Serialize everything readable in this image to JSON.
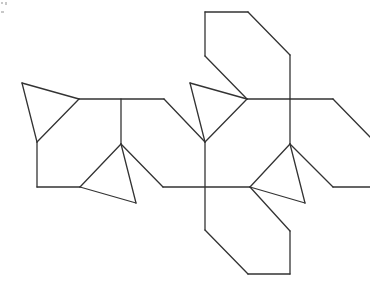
{
  "diagram": {
    "title": "",
    "type": "net-of-polyhedron",
    "stroke_color": "#333333",
    "stroke_width": 1.3,
    "background": "#ffffff",
    "segments": [
      [
        22,
        83,
        79,
        99
      ],
      [
        79,
        99,
        37,
        142
      ],
      [
        37,
        142,
        22,
        83
      ],
      [
        79,
        99,
        164,
        99
      ],
      [
        121,
        99,
        121,
        144
      ],
      [
        37,
        142,
        37,
        187
      ],
      [
        37,
        187,
        80,
        187
      ],
      [
        121,
        144,
        80,
        187
      ],
      [
        80,
        187,
        136,
        203
      ],
      [
        136,
        203,
        121,
        144
      ],
      [
        121,
        144,
        163,
        187
      ],
      [
        163,
        187,
        250,
        187
      ],
      [
        164,
        99,
        205,
        142
      ],
      [
        190,
        83,
        247,
        99
      ],
      [
        247,
        99,
        205,
        142
      ],
      [
        205,
        142,
        190,
        83
      ],
      [
        205,
        12,
        248,
        12
      ],
      [
        248,
        12,
        290,
        55
      ],
      [
        290,
        55,
        290,
        99
      ],
      [
        205,
        12,
        205,
        56
      ],
      [
        205,
        56,
        247,
        99
      ],
      [
        247,
        99,
        333,
        99
      ],
      [
        333,
        99,
        370,
        137
      ],
      [
        290,
        99,
        290,
        144
      ],
      [
        290,
        144,
        250,
        187
      ],
      [
        250,
        187,
        305,
        203
      ],
      [
        305,
        203,
        290,
        144
      ],
      [
        290,
        144,
        333,
        187
      ],
      [
        333,
        187,
        370,
        187
      ],
      [
        205,
        142,
        205,
        230
      ],
      [
        205,
        230,
        248,
        274
      ],
      [
        248,
        274,
        290,
        274
      ],
      [
        290,
        274,
        290,
        231
      ],
      [
        290,
        231,
        250,
        187
      ]
    ]
  }
}
